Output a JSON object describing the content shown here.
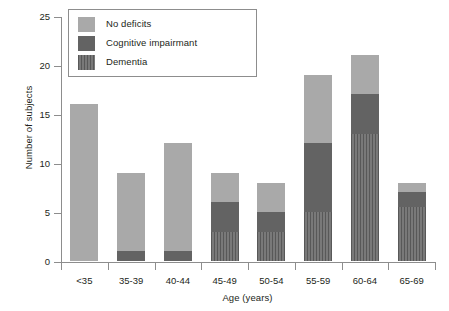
{
  "chart_data": {
    "type": "bar",
    "subtype": "stacked-bar",
    "title": "",
    "xlabel": "Age (years)",
    "ylabel": "Number of subjects",
    "categories": [
      "<35",
      "35-39",
      "40-44",
      "45-49",
      "50-54",
      "55-59",
      "60-64",
      "65-69"
    ],
    "series": [
      {
        "name": "No deficits",
        "color": "#a9a9a9",
        "values": [
          16,
          8,
          11,
          3,
          3,
          7,
          4,
          1
        ]
      },
      {
        "name": "Cognitive impairmant",
        "color": "#636363",
        "values": [
          0,
          1,
          1,
          3,
          2,
          7,
          4,
          1.5
        ]
      },
      {
        "name": "Dementia",
        "color": "#6a6a6a",
        "values": [
          0,
          0,
          0,
          3,
          3,
          5,
          13,
          5.5
        ]
      }
    ],
    "totals": [
      16,
      9,
      12,
      9,
      8,
      19,
      21,
      8
    ],
    "ylim": [
      0,
      25
    ],
    "yticks": [
      0,
      5,
      10,
      15,
      20,
      25
    ],
    "ytick_labels": [
      "0",
      "5",
      "10",
      "15",
      "20",
      "25"
    ],
    "grid": false,
    "legend_position": "upper-left",
    "stack_order_bottom_to_top": [
      "Dementia",
      "Cognitive impairmant",
      "No deficits"
    ]
  },
  "legend": {
    "items": [
      {
        "label": "No deficits",
        "swatch": "legend-swatch-no-deficits"
      },
      {
        "label": "Cognitive impairmant",
        "swatch": "legend-swatch-cognitive-impairmant"
      },
      {
        "label": "Dementia",
        "swatch": "legend-swatch-dementia"
      }
    ]
  }
}
